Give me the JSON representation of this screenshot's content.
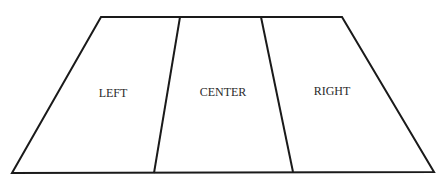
{
  "diagram": {
    "type": "trapezoid-divided",
    "regions": [
      {
        "id": "left",
        "label": "LEFT"
      },
      {
        "id": "center",
        "label": "CENTER"
      },
      {
        "id": "right",
        "label": "RIGHT"
      }
    ],
    "stroke_color": "#1a1a1a",
    "background": "#ffffff"
  }
}
